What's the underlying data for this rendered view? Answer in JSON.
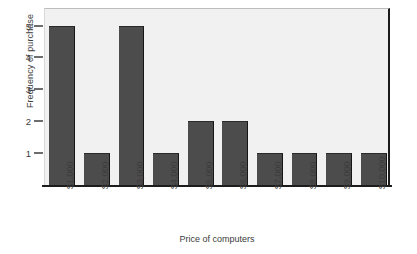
{
  "chart_data": {
    "type": "bar",
    "title": "",
    "subtitle": "",
    "xlabel": "Price of computers",
    "ylabel": "Frequency of purchase",
    "categories": [
      "$1,000",
      "$2,000",
      "$3,000",
      "$4,000",
      "$5,000",
      "$6,000",
      "$7,000",
      "$8,000",
      "$9,000",
      "$10,000"
    ],
    "values": [
      5,
      1,
      5,
      1,
      2,
      2,
      1,
      1,
      1,
      1
    ],
    "ylim": [
      0,
      5.55
    ],
    "yticks": [
      1,
      2,
      3,
      4,
      5
    ],
    "ytick_labels": [
      "1",
      "2",
      "3",
      "4",
      "5"
    ],
    "xtick_rotation": 90,
    "grid": false,
    "legend": false,
    "bar_color": "#4c4c4c",
    "bar_edge_color": "#161616",
    "plot_background": "#f1f1f1",
    "axis_color": "#1c1c1c",
    "text_color": "#3c3c3c"
  }
}
